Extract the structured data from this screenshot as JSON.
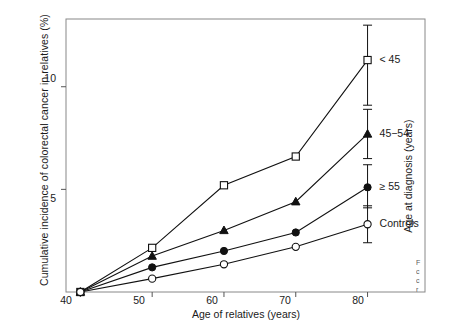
{
  "chart_data": {
    "type": "line",
    "title": "",
    "xlabel": "Age of relatives (years)",
    "ylabel": "Cumulative incidence of colorectal cancer in relatives (%)",
    "right_axis_label": "Age at diagnosis (years)",
    "x": [
      40,
      50,
      60,
      70,
      80
    ],
    "xlim": [
      38,
      88
    ],
    "ylim": [
      0,
      13.3
    ],
    "xticks": [
      "40",
      "50",
      "60",
      "70",
      "80"
    ],
    "yticks": [
      "5",
      "10"
    ],
    "ytick_values": [
      5,
      10
    ],
    "grid": false,
    "legend_position": "right-inline",
    "series": [
      {
        "name": "< 45",
        "marker": "open-square",
        "values": [
          0,
          2.15,
          5.2,
          6.6,
          11.3
        ],
        "error_low": [
          null,
          null,
          null,
          null,
          9.1
        ],
        "error_high": [
          null,
          null,
          null,
          null,
          13.0
        ],
        "label_x": 80,
        "label_y": 11.3
      },
      {
        "name": "45−54",
        "marker": "filled-triangle",
        "values": [
          0,
          1.75,
          3.0,
          4.4,
          7.7
        ],
        "error_low": [
          null,
          null,
          null,
          null,
          6.5
        ],
        "error_high": [
          null,
          null,
          null,
          null,
          8.9
        ],
        "label_x": 80,
        "label_y": 7.7
      },
      {
        "name": "≥ 55",
        "marker": "filled-circle",
        "values": [
          0,
          1.2,
          2.0,
          2.9,
          5.1
        ],
        "error_low": [
          null,
          null,
          null,
          null,
          4.1
        ],
        "error_high": [
          null,
          null,
          null,
          null,
          6.2
        ],
        "label_x": 80,
        "label_y": 5.1
      },
      {
        "name": "Controls",
        "marker": "open-circle",
        "values": [
          0,
          0.65,
          1.35,
          2.2,
          3.3
        ],
        "error_low": [
          null,
          null,
          null,
          null,
          2.4
        ],
        "error_high": [
          null,
          null,
          null,
          null,
          4.2
        ],
        "label_x": 80,
        "label_y": 3.3
      }
    ]
  },
  "caption": {
    "line1": "F",
    "line2": "c",
    "line3": "c",
    "line4": "r"
  }
}
